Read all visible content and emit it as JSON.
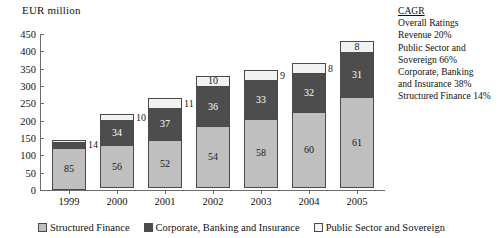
{
  "chart_data": {
    "type": "bar",
    "subtype": "stacked-bar",
    "title": "",
    "ylabel": "EUR million",
    "xlabel": "",
    "ylim": [
      0,
      450
    ],
    "ytick_step": 50,
    "yticks": [
      "450",
      "400",
      "350",
      "300",
      "250",
      "200",
      "150",
      "100",
      "50",
      "0"
    ],
    "grid": false,
    "legend_position": "bottom",
    "categories": [
      "1999",
      "2000",
      "2001",
      "2002",
      "2003",
      "2004",
      "2005"
    ],
    "value_unit": "percent share (labels); EUR million (axis)",
    "series": [
      {
        "name": "Structured Finance",
        "color": "#bfbfbf",
        "values": [
          85,
          56,
          52,
          54,
          58,
          60,
          61
        ],
        "amounts_eur_million": [
          123,
          123,
          137,
          178,
          200,
          219,
          262
        ]
      },
      {
        "name": "Corporate, Banking and Insurance",
        "color": "#4d4d4d",
        "values": [
          14,
          34,
          37,
          36,
          33,
          32,
          31
        ],
        "amounts_eur_million": [
          20,
          75,
          98,
          119,
          114,
          117,
          133
        ]
      },
      {
        "name": "Public Sector and Sovereign",
        "color": "#f2f2f2",
        "values": [
          1,
          10,
          11,
          10,
          9,
          8,
          8
        ],
        "amounts_eur_million": [
          2,
          22,
          29,
          33,
          31,
          29,
          34
        ]
      }
    ],
    "totals_eur_million": [
      145,
      220,
      264,
      330,
      345,
      365,
      430
    ],
    "annotations": [
      "CAGR",
      "Overall Ratings Revenue 20%",
      "Public Sector and Sovereign 66%",
      "Corporate, Banking and Insurance 38%",
      "Structured Finance 14%"
    ]
  },
  "axis": {
    "y_title": "EUR million",
    "y_ticks": [
      "450",
      "400",
      "350",
      "300",
      "250",
      "200",
      "150",
      "100",
      "50",
      "0"
    ],
    "x_ticks": [
      "1999",
      "2000",
      "2001",
      "2002",
      "2003",
      "2004",
      "2005"
    ]
  },
  "bars": [
    {
      "year": "1999",
      "segments": [
        {
          "key": "sf",
          "label": "85"
        },
        {
          "key": "cbi",
          "label": "14"
        },
        {
          "key": "pss",
          "label": ""
        }
      ]
    },
    {
      "year": "2000",
      "segments": [
        {
          "key": "sf",
          "label": "56"
        },
        {
          "key": "cbi",
          "label": "34"
        },
        {
          "key": "pss",
          "label": "10"
        }
      ]
    },
    {
      "year": "2001",
      "segments": [
        {
          "key": "sf",
          "label": "52"
        },
        {
          "key": "cbi",
          "label": "37"
        },
        {
          "key": "pss",
          "label": "11"
        }
      ]
    },
    {
      "year": "2002",
      "segments": [
        {
          "key": "sf",
          "label": "54"
        },
        {
          "key": "cbi",
          "label": "36"
        },
        {
          "key": "pss",
          "label": "10"
        }
      ]
    },
    {
      "year": "2003",
      "segments": [
        {
          "key": "sf",
          "label": "58"
        },
        {
          "key": "cbi",
          "label": "33"
        },
        {
          "key": "pss",
          "label": "9"
        }
      ]
    },
    {
      "year": "2004",
      "segments": [
        {
          "key": "sf",
          "label": "60"
        },
        {
          "key": "cbi",
          "label": "32"
        },
        {
          "key": "pss",
          "label": "8"
        }
      ]
    },
    {
      "year": "2005",
      "segments": [
        {
          "key": "sf",
          "label": "61"
        },
        {
          "key": "cbi",
          "label": "31"
        },
        {
          "key": "pss",
          "label": "8"
        }
      ]
    }
  ],
  "legend": {
    "items": [
      {
        "key": "sf",
        "label": "Structured Finance"
      },
      {
        "key": "cbi",
        "label": "Corporate, Banking and Insurance"
      },
      {
        "key": "pss",
        "label": "Public Sector and Sovereign"
      }
    ]
  },
  "cagr": {
    "title": "CAGR",
    "lines": [
      "Overall Ratings",
      "Revenue 20%",
      "Public Sector and",
      "Sovereign 66%",
      "Corporate, Banking",
      "and Insurance 38%",
      "Structured Finance 14%"
    ]
  },
  "colors": {
    "structured_finance": "#bfbfbf",
    "corporate_banking_insurance": "#4d4d4d",
    "public_sector_sovereign": "#f2f2f2",
    "axis": "#6b6b6b",
    "text": "#111111"
  }
}
